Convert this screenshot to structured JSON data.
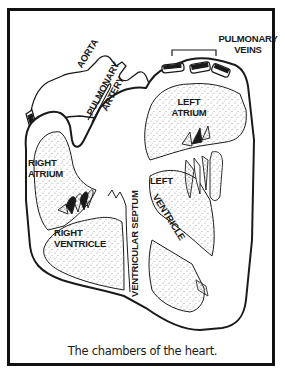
{
  "figure": {
    "caption": "The chambers of the heart.",
    "labels": {
      "pulmonary_veins_line1": "PULMONARY",
      "pulmonary_veins_line2": "VEINS",
      "aorta": "AORTA",
      "pulmonary_artery_line1": "PULMONARY",
      "pulmonary_artery_line2": "ARTERY",
      "left_atrium_line1": "LEFT",
      "left_atrium_line2": "ATRIUM",
      "right_atrium_line1": "RIGHT",
      "right_atrium_line2": "ATRIUM",
      "left_ventricle_line1": "LEFT",
      "left_ventricle_line2": "VENTRICLE",
      "right_ventricle_line1": "RIGHT",
      "right_ventricle_line2": "VENTRICLE",
      "ventricular_septum": "VENTRICULAR SEPTUM"
    },
    "colors": {
      "ink": "#1a1a1a",
      "background": "#ffffff",
      "frame": "#111111"
    }
  }
}
